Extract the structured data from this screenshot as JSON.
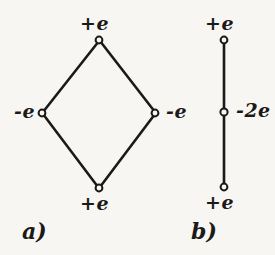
{
  "figure": {
    "background_color": "#f7f6f3",
    "ink_color": "#1b1a18",
    "node_fill_color": "#f7f6f3",
    "panels": [
      {
        "id": "a",
        "caption": "a)",
        "shape": "rhombus",
        "nodes": [
          {
            "id": "a-top",
            "label": "+e",
            "x": 99,
            "y": 40,
            "label_position": "above"
          },
          {
            "id": "a-left",
            "label": "-e",
            "x": 42,
            "y": 113,
            "label_position": "left"
          },
          {
            "id": "a-right",
            "label": "-e",
            "x": 155,
            "y": 113,
            "label_position": "right"
          },
          {
            "id": "a-bottom",
            "label": "+e",
            "x": 99,
            "y": 188,
            "label_position": "below"
          }
        ],
        "edges": [
          {
            "from": "a-top",
            "to": "a-left"
          },
          {
            "from": "a-left",
            "to": "a-bottom"
          },
          {
            "from": "a-bottom",
            "to": "a-right"
          },
          {
            "from": "a-right",
            "to": "a-top"
          }
        ]
      },
      {
        "id": "b",
        "caption": "b)",
        "shape": "vertical-line",
        "nodes": [
          {
            "id": "b-top",
            "label": "+e",
            "x": 224,
            "y": 40,
            "label_position": "above"
          },
          {
            "id": "b-middle",
            "label": "-2e",
            "x": 224,
            "y": 112,
            "label_position": "right"
          },
          {
            "id": "b-bottom",
            "label": "+e",
            "x": 224,
            "y": 187,
            "label_position": "below"
          }
        ],
        "edges": [
          {
            "from": "b-top",
            "to": "b-middle"
          },
          {
            "from": "b-middle",
            "to": "b-bottom"
          }
        ]
      }
    ]
  },
  "labels": {
    "a_top": "+e",
    "a_left": "-e",
    "a_right": "-e",
    "a_bottom": "+e",
    "b_top": "+e",
    "b_middle": "-2e",
    "b_bottom": "+e"
  },
  "captions": {
    "a": "a)",
    "b": "b)"
  }
}
